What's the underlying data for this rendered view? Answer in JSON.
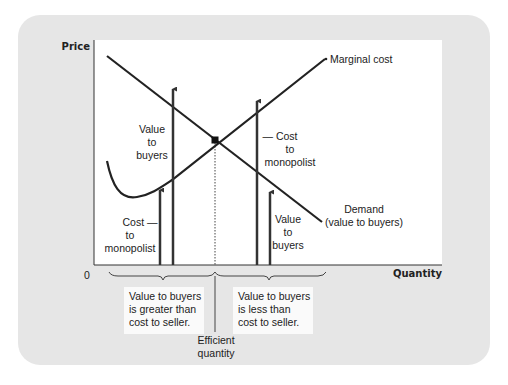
{
  "axes": {
    "y_label": "Price",
    "x_label": "Quantity",
    "origin_label": "0"
  },
  "curves": {
    "marginal_cost": "Marginal cost",
    "demand_line1": "Demand",
    "demand_line2": "(value to buyers)"
  },
  "left_arrows": {
    "value_label": [
      "Value",
      "to",
      "buyers"
    ],
    "cost_label": [
      "Cost —",
      "to",
      "monopolist"
    ]
  },
  "right_arrows": {
    "cost_label": [
      "— Cost",
      "to",
      "monopolist"
    ],
    "value_label": [
      "Value",
      "to",
      "buyers"
    ]
  },
  "boxes": {
    "left": [
      "Value to buyers",
      "is greater than",
      "cost to seller."
    ],
    "right": [
      "Value to buyers",
      "is less than",
      "cost to seller."
    ]
  },
  "efficient": [
    "Efficient",
    "quantity"
  ],
  "colors": {
    "panel": "#e6e6e6",
    "plot": "#ffffff",
    "line": "#222222"
  }
}
